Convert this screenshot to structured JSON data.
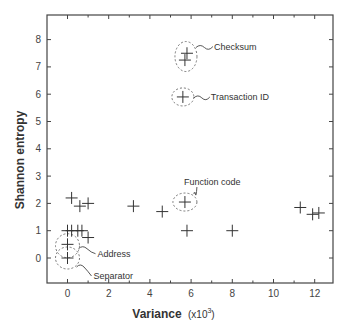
{
  "chart_data": {
    "type": "scatter",
    "title": "",
    "xlabel": "Variance",
    "xlabel_unit": "(x10^3)",
    "ylabel": "Shannon entropy",
    "xlim": [
      -1,
      13
    ],
    "ylim": [
      -0.9,
      8.9
    ],
    "xticks": [
      "0",
      "2",
      "4",
      "6",
      "8",
      "10",
      "12"
    ],
    "yticks": [
      "0",
      "1",
      "2",
      "3",
      "4",
      "5",
      "6",
      "7",
      "8"
    ],
    "grid": false,
    "marker": "plus",
    "points": [
      {
        "x": 0.2,
        "y": 2.2
      },
      {
        "x": 0.6,
        "y": 1.9
      },
      {
        "x": 1.0,
        "y": 2.0
      },
      {
        "x": 0.0,
        "y": 1.0
      },
      {
        "x": 0.2,
        "y": 1.0
      },
      {
        "x": 0.5,
        "y": 1.0
      },
      {
        "x": 0.7,
        "y": 1.0
      },
      {
        "x": 1.0,
        "y": 0.75
      },
      {
        "x": 0.0,
        "y": 0.5,
        "label": "Address"
      },
      {
        "x": 0.0,
        "y": 0.0,
        "label": "Separator"
      },
      {
        "x": 3.2,
        "y": 1.9
      },
      {
        "x": 4.6,
        "y": 1.7
      },
      {
        "x": 5.7,
        "y": 2.05,
        "label": "Function code"
      },
      {
        "x": 5.8,
        "y": 1.0
      },
      {
        "x": 8.0,
        "y": 1.0
      },
      {
        "x": 11.3,
        "y": 1.85
      },
      {
        "x": 11.9,
        "y": 1.6
      },
      {
        "x": 12.2,
        "y": 1.65
      },
      {
        "x": 5.6,
        "y": 5.9,
        "label": "Transaction ID"
      },
      {
        "x": 5.8,
        "y": 7.5,
        "label": "Checksum"
      },
      {
        "x": 5.7,
        "y": 7.25,
        "label": "Checksum"
      }
    ],
    "annotations": [
      {
        "text": "Checksum",
        "x": 5.75,
        "y": 7.4
      },
      {
        "text": "Transaction ID",
        "x": 5.6,
        "y": 5.9
      },
      {
        "text": "Function code",
        "x": 5.7,
        "y": 2.05
      },
      {
        "text": "Address",
        "x": 0.0,
        "y": 0.5
      },
      {
        "text": "Separator",
        "x": 0.0,
        "y": 0.0
      }
    ]
  },
  "labels": {
    "xlabel": "Variance",
    "xunit": "(x10",
    "xunit_exp": "3",
    "xunit_close": ")",
    "ylabel": "Shannon entropy",
    "checksum": "Checksum",
    "transaction_id": "Transaction ID",
    "function_code": "Function code",
    "address": "Address",
    "separator": "Separator"
  }
}
